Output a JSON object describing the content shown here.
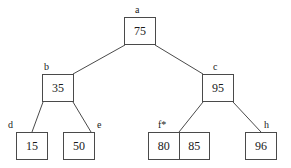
{
  "diagram": {
    "stroke_color": "#4a4a4a",
    "text_color": "#1a1a1a",
    "background_color": "#ffffff",
    "nodes": [
      {
        "id": "a",
        "label": "a",
        "values": [
          "75"
        ],
        "x": 124,
        "y": 17,
        "w": 32,
        "h": 28,
        "label_x": 135,
        "label_y": 5
      },
      {
        "id": "b",
        "label": "b",
        "values": [
          "35"
        ],
        "x": 42,
        "y": 74,
        "w": 32,
        "h": 28,
        "label_x": 44,
        "label_y": 62
      },
      {
        "id": "c",
        "label": "c",
        "values": [
          "95"
        ],
        "x": 202,
        "y": 74,
        "w": 32,
        "h": 28,
        "label_x": 213,
        "label_y": 62
      },
      {
        "id": "d",
        "label": "d",
        "values": [
          "15"
        ],
        "x": 16,
        "y": 132,
        "w": 32,
        "h": 28,
        "label_x": 8,
        "label_y": 120
      },
      {
        "id": "e",
        "label": "e",
        "values": [
          "50"
        ],
        "x": 63,
        "y": 132,
        "w": 32,
        "h": 28,
        "label_x": 97,
        "label_y": 120
      },
      {
        "id": "f",
        "label": "f*",
        "values": [
          "80",
          "85"
        ],
        "x": 148,
        "y": 132,
        "w": 62,
        "h": 28,
        "label_x": 158,
        "label_y": 120
      },
      {
        "id": "h",
        "label": "h",
        "values": [
          "96"
        ],
        "x": 245,
        "y": 132,
        "w": 32,
        "h": 28,
        "label_x": 264,
        "label_y": 120
      }
    ],
    "edges": [
      {
        "from": "a",
        "to": "b",
        "x1": 125,
        "y1": 45,
        "x2": 73,
        "y2": 74
      },
      {
        "from": "a",
        "to": "c",
        "x1": 155,
        "y1": 45,
        "x2": 203,
        "y2": 74
      },
      {
        "from": "b",
        "to": "d",
        "x1": 43,
        "y1": 102,
        "x2": 32,
        "y2": 132
      },
      {
        "from": "b",
        "to": "e",
        "x1": 73,
        "y1": 102,
        "x2": 91,
        "y2": 132
      },
      {
        "from": "c",
        "to": "f",
        "x1": 203,
        "y1": 102,
        "x2": 179,
        "y2": 132
      },
      {
        "from": "c",
        "to": "h",
        "x1": 233,
        "y1": 102,
        "x2": 261,
        "y2": 132
      }
    ]
  }
}
